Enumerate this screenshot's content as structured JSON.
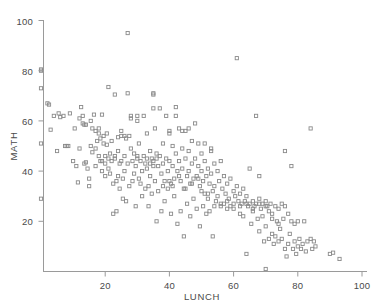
{
  "chart_data": {
    "type": "scatter",
    "title": "",
    "xlabel": "LUNCH",
    "ylabel": "MATH",
    "xlim": [
      0,
      100
    ],
    "ylim": [
      0,
      100
    ],
    "xticks": [
      20,
      40,
      60,
      80,
      100
    ],
    "yticks": [
      20,
      40,
      60,
      80,
      100
    ],
    "xtick_labels": [
      "20",
      "40",
      "60",
      "80",
      "100"
    ],
    "ytick_labels": [
      "20",
      "40",
      "60",
      "80",
      "100"
    ],
    "grid": false,
    "legend": false,
    "marker": "open-square",
    "marker_color": "#8a8a8a",
    "marker_size": 3.2,
    "n_points": 298,
    "correlation_note": "negative",
    "points": [
      [
        0,
        80
      ],
      [
        0,
        80.5
      ],
      [
        0,
        73
      ],
      [
        0,
        51
      ],
      [
        0,
        29
      ],
      [
        2,
        67
      ],
      [
        2.5,
        66.5
      ],
      [
        3,
        56.5
      ],
      [
        4,
        62
      ],
      [
        5,
        48
      ],
      [
        5.5,
        63
      ],
      [
        6,
        61.5
      ],
      [
        7,
        62
      ],
      [
        7.5,
        50
      ],
      [
        8,
        50
      ],
      [
        8.5,
        50
      ],
      [
        9,
        63
      ],
      [
        11,
        42
      ],
      [
        11.5,
        35.5
      ],
      [
        12,
        49
      ],
      [
        12.5,
        65.5
      ],
      [
        13,
        59
      ],
      [
        13.5,
        58.5
      ],
      [
        13.5,
        43
      ],
      [
        14,
        43.5
      ],
      [
        14,
        58.5
      ],
      [
        14.5,
        41
      ],
      [
        15,
        37
      ],
      [
        15,
        34
      ],
      [
        15.5,
        50
      ],
      [
        16,
        47.5
      ],
      [
        16,
        57
      ],
      [
        16.5,
        62.5
      ],
      [
        17,
        56
      ],
      [
        17,
        49
      ],
      [
        17.5,
        52
      ],
      [
        18,
        55
      ],
      [
        18,
        57
      ],
      [
        18.5,
        53
      ],
      [
        18.5,
        44
      ],
      [
        19,
        62.5
      ],
      [
        19,
        40
      ],
      [
        19.5,
        51
      ],
      [
        19.5,
        54
      ],
      [
        20,
        46
      ],
      [
        20,
        38
      ],
      [
        20.5,
        55
      ],
      [
        20.5,
        50.5
      ],
      [
        21,
        73.5
      ],
      [
        21,
        45
      ],
      [
        21.5,
        47
      ],
      [
        21.5,
        39
      ],
      [
        22,
        52
      ],
      [
        22,
        44
      ],
      [
        22.5,
        35
      ],
      [
        22.5,
        23
      ],
      [
        23,
        70.5
      ],
      [
        23,
        45
      ],
      [
        23.5,
        36
      ],
      [
        23.5,
        24
      ],
      [
        24,
        48
      ],
      [
        24,
        38
      ],
      [
        24.5,
        43
      ],
      [
        24.5,
        33
      ],
      [
        25,
        56
      ],
      [
        25,
        44
      ],
      [
        25.5,
        37
      ],
      [
        25.5,
        29
      ],
      [
        26,
        46
      ],
      [
        26,
        40
      ],
      [
        26.5,
        28
      ],
      [
        26.5,
        53
      ],
      [
        27,
        95
      ],
      [
        27,
        71
      ],
      [
        27,
        43
      ],
      [
        27.5,
        54
      ],
      [
        27.5,
        34
      ],
      [
        28,
        61
      ],
      [
        28,
        49
      ],
      [
        28.5,
        44
      ],
      [
        28.5,
        36
      ],
      [
        29,
        47
      ],
      [
        29,
        39
      ],
      [
        29.5,
        42
      ],
      [
        29.5,
        26
      ],
      [
        30,
        60
      ],
      [
        30,
        45
      ],
      [
        30.5,
        51
      ],
      [
        30.5,
        37
      ],
      [
        31,
        44
      ],
      [
        31,
        35
      ],
      [
        31.5,
        40
      ],
      [
        31.5,
        30
      ],
      [
        32,
        62
      ],
      [
        32,
        46
      ],
      [
        32.5,
        43
      ],
      [
        32.5,
        33
      ],
      [
        33,
        55
      ],
      [
        33,
        41
      ],
      [
        33.5,
        34
      ],
      [
        33.5,
        26
      ],
      [
        34,
        48
      ],
      [
        34,
        38
      ],
      [
        34.5,
        45
      ],
      [
        34.5,
        31
      ],
      [
        35,
        70.5
      ],
      [
        35,
        71
      ],
      [
        35,
        44
      ],
      [
        35.5,
        57
      ],
      [
        35.5,
        36
      ],
      [
        36,
        47
      ],
      [
        36,
        20
      ],
      [
        36.5,
        42
      ],
      [
        36.5,
        32
      ],
      [
        37,
        65
      ],
      [
        37,
        46
      ],
      [
        37.5,
        39
      ],
      [
        37.5,
        24
      ],
      [
        38,
        51
      ],
      [
        38,
        43
      ],
      [
        38.5,
        36
      ],
      [
        38.5,
        28
      ],
      [
        39,
        62
      ],
      [
        39,
        45
      ],
      [
        39.5,
        40
      ],
      [
        39.5,
        33
      ],
      [
        40,
        55
      ],
      [
        40,
        44
      ],
      [
        40.5,
        35
      ],
      [
        40.5,
        23
      ],
      [
        41,
        50
      ],
      [
        41,
        42
      ],
      [
        41.5,
        37
      ],
      [
        41.5,
        30
      ],
      [
        42,
        65.5
      ],
      [
        42,
        47
      ],
      [
        42.5,
        40
      ],
      [
        42.5,
        19
      ],
      [
        43,
        57
      ],
      [
        43,
        44
      ],
      [
        43.5,
        36
      ],
      [
        43.5,
        24
      ],
      [
        44,
        49
      ],
      [
        44,
        41
      ],
      [
        44.5,
        33
      ],
      [
        44.5,
        14
      ],
      [
        45,
        56
      ],
      [
        45,
        45
      ],
      [
        45.5,
        38
      ],
      [
        45.5,
        27
      ],
      [
        46,
        48
      ],
      [
        46,
        40
      ],
      [
        46.5,
        35
      ],
      [
        46.5,
        22
      ],
      [
        47,
        52
      ],
      [
        47,
        43
      ],
      [
        47.5,
        37
      ],
      [
        47.5,
        29
      ],
      [
        48,
        59
      ],
      [
        48,
        45
      ],
      [
        48.5,
        38
      ],
      [
        48.5,
        25
      ],
      [
        49,
        51
      ],
      [
        49,
        42
      ],
      [
        49.5,
        34
      ],
      [
        49.5,
        18
      ],
      [
        50,
        47
      ],
      [
        50,
        40
      ],
      [
        50.5,
        36
      ],
      [
        50.5,
        26
      ],
      [
        51,
        44
      ],
      [
        51,
        31
      ],
      [
        51.5,
        38
      ],
      [
        51.5,
        23
      ],
      [
        52,
        41
      ],
      [
        52,
        29
      ],
      [
        52.5,
        35
      ],
      [
        52.5,
        24
      ],
      [
        53,
        48
      ],
      [
        53,
        39
      ],
      [
        53.5,
        32
      ],
      [
        53.5,
        14
      ],
      [
        54,
        43
      ],
      [
        54,
        34
      ],
      [
        54.5,
        28
      ],
      [
        55,
        40
      ],
      [
        55,
        30
      ],
      [
        55.5,
        36
      ],
      [
        56,
        44
      ],
      [
        56,
        26
      ],
      [
        56.5,
        33
      ],
      [
        57,
        38
      ],
      [
        57,
        27
      ],
      [
        57.5,
        31
      ],
      [
        58,
        35
      ],
      [
        58,
        25
      ],
      [
        58.5,
        29
      ],
      [
        59,
        37
      ],
      [
        59,
        26
      ],
      [
        60,
        32
      ],
      [
        60,
        27
      ],
      [
        60.5,
        30
      ],
      [
        61,
        85
      ],
      [
        61,
        34
      ],
      [
        61.5,
        28
      ],
      [
        62,
        31
      ],
      [
        62,
        26
      ],
      [
        62.5,
        27
      ],
      [
        63,
        33
      ],
      [
        63,
        22
      ],
      [
        63.5,
        28
      ],
      [
        64,
        30
      ],
      [
        64,
        7
      ],
      [
        64.5,
        26
      ],
      [
        65,
        41
      ],
      [
        65,
        27
      ],
      [
        65.5,
        19
      ],
      [
        66,
        28
      ],
      [
        66,
        24
      ],
      [
        66.5,
        26
      ],
      [
        67,
        62
      ],
      [
        67,
        27
      ],
      [
        67.5,
        21
      ],
      [
        68,
        38
      ],
      [
        68,
        29
      ],
      [
        68,
        16
      ],
      [
        68.5,
        25
      ],
      [
        69,
        27
      ],
      [
        69,
        22
      ],
      [
        69.5,
        12
      ],
      [
        70,
        28
      ],
      [
        70,
        18
      ],
      [
        70,
        1
      ],
      [
        70.5,
        26
      ],
      [
        71,
        24
      ],
      [
        71,
        13
      ],
      [
        71.5,
        27
      ],
      [
        72,
        23
      ],
      [
        72,
        15
      ],
      [
        72.5,
        11
      ],
      [
        73,
        26
      ],
      [
        73,
        14
      ],
      [
        73.5,
        20
      ],
      [
        74,
        25
      ],
      [
        74,
        12
      ],
      [
        74.5,
        17
      ],
      [
        75,
        27
      ],
      [
        75,
        13
      ],
      [
        75.5,
        21
      ],
      [
        76,
        48
      ],
      [
        76,
        26
      ],
      [
        76,
        9
      ],
      [
        76.5,
        6
      ],
      [
        77,
        23
      ],
      [
        77,
        11
      ],
      [
        77.5,
        15
      ],
      [
        78,
        42
      ],
      [
        78,
        20
      ],
      [
        78.5,
        9
      ],
      [
        79,
        19
      ],
      [
        79,
        12
      ],
      [
        79.5,
        7
      ],
      [
        80,
        20
      ],
      [
        80,
        10
      ],
      [
        80.5,
        13
      ],
      [
        81,
        9
      ],
      [
        81.5,
        11
      ],
      [
        82,
        20
      ],
      [
        82.5,
        8
      ],
      [
        83,
        12
      ],
      [
        84,
        57
      ],
      [
        84,
        13
      ],
      [
        84.5,
        9
      ],
      [
        85,
        12
      ],
      [
        85.5,
        10
      ],
      [
        90,
        7
      ],
      [
        91,
        7.5
      ],
      [
        93,
        5
      ],
      [
        10,
        44
      ],
      [
        10.5,
        57
      ],
      [
        12,
        61
      ],
      [
        13,
        62
      ],
      [
        15.5,
        60
      ],
      [
        17,
        42
      ],
      [
        18,
        46
      ],
      [
        19,
        44
      ],
      [
        20,
        43
      ],
      [
        21,
        41
      ],
      [
        23,
        46
      ],
      [
        24,
        53.5
      ],
      [
        25,
        54
      ],
      [
        26,
        54
      ],
      [
        30,
        46
      ],
      [
        33,
        45
      ],
      [
        34,
        43
      ],
      [
        35,
        42
      ],
      [
        36,
        45
      ],
      [
        38,
        34
      ],
      [
        40,
        36
      ],
      [
        41,
        34
      ],
      [
        43,
        38
      ],
      [
        45,
        33
      ],
      [
        47,
        35
      ],
      [
        49,
        37
      ],
      [
        50,
        32
      ],
      [
        52,
        31
      ],
      [
        54,
        26
      ],
      [
        56,
        27
      ],
      [
        58,
        28
      ],
      [
        60,
        25
      ],
      [
        62,
        23
      ],
      [
        64,
        27
      ],
      [
        66,
        25
      ],
      [
        68,
        27
      ],
      [
        70,
        26
      ],
      [
        72,
        21
      ],
      [
        74,
        19
      ],
      [
        53,
        49
      ],
      [
        51,
        51
      ],
      [
        46,
        57
      ],
      [
        44,
        56
      ],
      [
        42,
        62
      ],
      [
        40,
        56
      ],
      [
        35,
        65
      ],
      [
        30,
        62
      ],
      [
        28,
        62
      ]
    ]
  },
  "axes": {
    "x_axis_name": "lunch-axis",
    "y_axis_name": "math-axis"
  }
}
